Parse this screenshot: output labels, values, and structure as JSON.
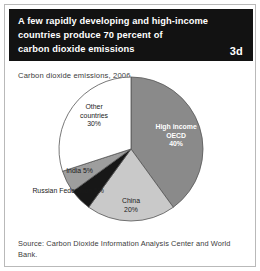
{
  "figure": {
    "badge": "3d",
    "title_lines": [
      "A few rapidly developing and high-income",
      "countries produce 70 percent of",
      "carbon dioxide emissions"
    ],
    "subtitle": "Carbon dioxide emissions, 2006",
    "source": "Source: Carbon Dioxide Information Analysis Center and World Bank."
  },
  "colors": {
    "header_background": "#121212",
    "header_text": "#ffffff",
    "card_border": "#b9b9b9",
    "pie_outline": "#555555",
    "leader_line": "#7a7a7a",
    "high_income_oecd": "#8a8a8a",
    "china": "#c9c9c9",
    "india": "#171717",
    "russian_federation": "#9e9e9e",
    "other_countries": "#ffffff"
  },
  "chart_data": {
    "type": "pie",
    "title": "A few rapidly developing and high-income countries produce 70 percent of carbon dioxide emissions",
    "subtitle": "Carbon dioxide emissions, 2006",
    "unit": "percent",
    "total": 100,
    "legend_position": "none",
    "labels_inline": true,
    "start_angle_deg": 0,
    "direction": "clockwise",
    "categories": [
      "High income OECD",
      "China",
      "India",
      "Russian Federation",
      "Other countries"
    ],
    "values": [
      40,
      20,
      5,
      5,
      30
    ],
    "slices": [
      {
        "name": "High income OECD",
        "value": 40,
        "value_label": "40%",
        "label_lines": [
          "High income",
          "OECD",
          "40%"
        ],
        "color": "#8a8a8a",
        "label_style": "inside-inverse"
      },
      {
        "name": "China",
        "value": 20,
        "value_label": "20%",
        "label_lines": [
          "China",
          "20%"
        ],
        "color": "#c9c9c9",
        "label_style": "inside"
      },
      {
        "name": "India",
        "value": 5,
        "value_label": "5%",
        "label_lines": [
          "India 5%"
        ],
        "color": "#171717",
        "label_style": "callout-left"
      },
      {
        "name": "Russian Federation",
        "value": 5,
        "value_label": "5%",
        "label_lines": [
          "Russian Federation 5%"
        ],
        "color": "#9e9e9e",
        "label_style": "callout-left"
      },
      {
        "name": "Other countries",
        "value": 30,
        "value_label": "30%",
        "label_lines": [
          "Other",
          "countries",
          "30%"
        ],
        "color": "#ffffff",
        "label_style": "inside"
      }
    ]
  }
}
